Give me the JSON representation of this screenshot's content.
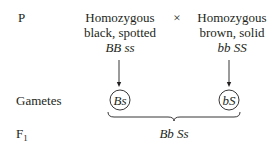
{
  "rows": {
    "p_label": "P",
    "gametes_label": "Gametes",
    "f1_label": "F",
    "f1_sub": "1"
  },
  "parents": [
    {
      "line1": "Homozygous",
      "line2": "black, spotted",
      "genotype": "BB ss",
      "gamete": "Bs"
    },
    {
      "line1": "Homozygous",
      "line2": "brown, solid",
      "genotype": "bb SS",
      "gamete": "bS"
    }
  ],
  "cross_symbol": "×",
  "offspring_genotype": "Bb Ss",
  "colors": {
    "text": "#231f20",
    "line": "#231f20"
  }
}
